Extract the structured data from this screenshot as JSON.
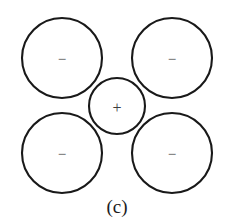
{
  "figure": {
    "caption": "(c)",
    "caption_x": 117,
    "caption_y": 206,
    "width": 231,
    "height": 223,
    "background_color": "#ffffff",
    "stroke_color": "#191919",
    "glyph_color": "#4a4a4a"
  },
  "ions": [
    {
      "id": "anion-top-left",
      "charge_symbol": "−",
      "charge_sign": "negative",
      "cx": 62,
      "cy": 58,
      "r": 40,
      "glyph_x": 62,
      "glyph_y": 59
    },
    {
      "id": "anion-top-right",
      "charge_symbol": "−",
      "charge_sign": "negative",
      "cx": 172,
      "cy": 58,
      "r": 40,
      "glyph_x": 172,
      "glyph_y": 59
    },
    {
      "id": "anion-bottom-left",
      "charge_symbol": "−",
      "charge_sign": "negative",
      "cx": 62,
      "cy": 153,
      "r": 40,
      "glyph_x": 62,
      "glyph_y": 154
    },
    {
      "id": "anion-bottom-right",
      "charge_symbol": "−",
      "charge_sign": "negative",
      "cx": 172,
      "cy": 153,
      "r": 40,
      "glyph_x": 172,
      "glyph_y": 154
    },
    {
      "id": "cation-center",
      "charge_symbol": "+",
      "charge_sign": "positive",
      "cx": 117,
      "cy": 106,
      "r": 28,
      "glyph_x": 117,
      "glyph_y": 107
    }
  ]
}
